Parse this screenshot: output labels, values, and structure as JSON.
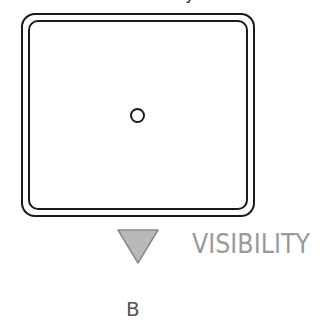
{
  "diagram": {
    "top_cutoff_text": "y",
    "frame": {
      "shape": "rounded-rectangle-double-border",
      "stroke_color": "#1a1a1a"
    },
    "center_marker": {
      "shape": "circle",
      "icon": "circle-outline-icon"
    },
    "indicator": {
      "icon": "down-triangle-icon",
      "fill_color": "#b9b9b9",
      "stroke_color": "#8a8a8a",
      "label": "VISIBILITY",
      "label_color": "#9a9a9a"
    },
    "panel_label": "B"
  }
}
